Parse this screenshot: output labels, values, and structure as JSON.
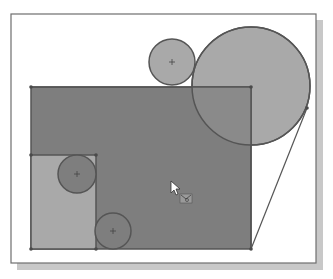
{
  "viewport": {
    "background": "#ffffff",
    "frame": {
      "x": 11,
      "y": 14,
      "w": 305,
      "h": 249,
      "stroke": "#6e6e6e",
      "shadow": "#c8c8c8"
    }
  },
  "sketch": {
    "colors": {
      "outline": "#555555",
      "region_dark": "#7e7e7e",
      "region_light": "#a9a9a9",
      "region_mid": "#8a8a8a",
      "vertex": "#4a4a4a"
    },
    "main_rectangle": {
      "x": 31,
      "y": 87,
      "w": 220,
      "h": 162
    },
    "inner_rectangle": {
      "x": 31,
      "y": 155,
      "w": 65,
      "h": 94
    },
    "circles": [
      {
        "id": "small-top",
        "cx": 172,
        "cy": 62,
        "r": 23
      },
      {
        "id": "large-right",
        "cx": 251,
        "cy": 86,
        "r": 59
      },
      {
        "id": "inner-left",
        "cx": 77,
        "cy": 174,
        "r": 19
      },
      {
        "id": "bottom",
        "cx": 113,
        "cy": 231,
        "r": 18
      }
    ],
    "tangent_line": {
      "x1": 251,
      "y1": 249,
      "x2": 307,
      "y2": 108
    }
  },
  "cursor": {
    "x": 171,
    "y": 181,
    "icon": "pointer-with-profile-select-icon"
  }
}
